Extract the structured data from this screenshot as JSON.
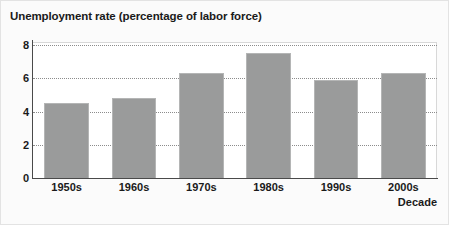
{
  "chart_data": {
    "type": "bar",
    "title": "Unemployment rate (percentage of labor force)",
    "xlabel": "Decade",
    "ylabel": "",
    "categories": [
      "1950s",
      "1960s",
      "1970s",
      "1980s",
      "1990s",
      "2000s"
    ],
    "values": [
      4.5,
      4.8,
      6.3,
      7.5,
      5.9,
      6.3
    ],
    "ylim": [
      0,
      8.4
    ],
    "yticks": [
      0,
      2,
      4,
      6,
      8
    ],
    "ytick_labels": [
      "0",
      "2",
      "4",
      "6",
      "8"
    ],
    "grid": "horizontal-dotted",
    "legend": "none",
    "series": [
      {
        "name": "Unemployment rate",
        "values": [
          4.5,
          4.8,
          6.3,
          7.5,
          5.9,
          6.3
        ]
      }
    ],
    "colors": {
      "bar_fill": "#9a9b9b",
      "bar_border": "#b4b5b5",
      "axis": "#4a4a4a",
      "gridline": "#8c8c8c",
      "text": "#1a1a1a",
      "plot_background": "#ffffff",
      "figure_background": "#fbfbfb"
    }
  }
}
